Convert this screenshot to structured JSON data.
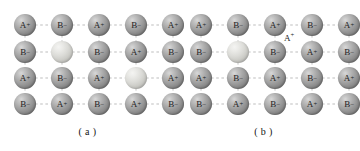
{
  "figure": {
    "kind": "crystal-lattice-defect-diagram",
    "background_color": "#ffffff",
    "bond_color": "#bdbdbd",
    "ion_color": "#909090",
    "vacancy_color": "#dcdcd8",
    "label_color": "#1d1d1d"
  },
  "layout": {
    "columns": 5,
    "rows": 4,
    "col_x": [
      25,
      62,
      99,
      136,
      173
    ],
    "row_y": [
      25,
      52,
      78,
      104
    ],
    "node_radius": 11
  },
  "panels": [
    {
      "id": "a",
      "caption": "( a )",
      "grid": [
        [
          {
            "label": "A",
            "sign": "+",
            "type": "ion"
          },
          {
            "label": "B",
            "sign": "–",
            "type": "ion"
          },
          {
            "label": "A",
            "sign": "+",
            "type": "ion"
          },
          {
            "label": "B",
            "sign": "–",
            "type": "ion"
          },
          {
            "label": "A",
            "sign": "+",
            "type": "ion"
          }
        ],
        [
          {
            "label": "B",
            "sign": "–",
            "type": "ion"
          },
          {
            "label": "",
            "sign": "",
            "type": "vacancy"
          },
          {
            "label": "B",
            "sign": "–",
            "type": "ion"
          },
          {
            "label": "A",
            "sign": "+",
            "type": "ion"
          },
          {
            "label": "B",
            "sign": "–",
            "type": "ion"
          }
        ],
        [
          {
            "label": "A",
            "sign": "+",
            "type": "ion"
          },
          {
            "label": "B",
            "sign": "–",
            "type": "ion"
          },
          {
            "label": "A",
            "sign": "+",
            "type": "ion"
          },
          {
            "label": "",
            "sign": "",
            "type": "vacancy"
          },
          {
            "label": "A",
            "sign": "+",
            "type": "ion"
          }
        ],
        [
          {
            "label": "B",
            "sign": "–",
            "type": "ion"
          },
          {
            "label": "A",
            "sign": "+",
            "type": "ion"
          },
          {
            "label": "B",
            "sign": "–",
            "type": "ion"
          },
          {
            "label": "A",
            "sign": "+",
            "type": "ion"
          },
          {
            "label": "B",
            "sign": "–",
            "type": "ion"
          }
        ]
      ],
      "interstitials": []
    },
    {
      "id": "b",
      "caption": "( b )",
      "grid": [
        [
          {
            "label": "A",
            "sign": "+",
            "type": "ion"
          },
          {
            "label": "B",
            "sign": "–",
            "type": "ion"
          },
          {
            "label": "A",
            "sign": "+",
            "type": "ion"
          },
          {
            "label": "B",
            "sign": "–",
            "type": "ion"
          },
          {
            "label": "A",
            "sign": "+",
            "type": "ion"
          }
        ],
        [
          {
            "label": "B",
            "sign": "–",
            "type": "ion"
          },
          {
            "label": "",
            "sign": "",
            "type": "vacancy"
          },
          {
            "label": "B",
            "sign": "–",
            "type": "ion"
          },
          {
            "label": "A",
            "sign": "+",
            "type": "ion"
          },
          {
            "label": "B",
            "sign": "–",
            "type": "ion"
          }
        ],
        [
          {
            "label": "A",
            "sign": "+",
            "type": "ion"
          },
          {
            "label": "B",
            "sign": "–",
            "type": "ion"
          },
          {
            "label": "A",
            "sign": "+",
            "type": "ion"
          },
          {
            "label": "B",
            "sign": "–",
            "type": "ion"
          },
          {
            "label": "A",
            "sign": "+",
            "type": "ion"
          }
        ],
        [
          {
            "label": "B",
            "sign": "–",
            "type": "ion"
          },
          {
            "label": "A",
            "sign": "+",
            "type": "ion"
          },
          {
            "label": "B",
            "sign": "–",
            "type": "ion"
          },
          {
            "label": "A",
            "sign": "+",
            "type": "ion"
          },
          {
            "label": "B",
            "sign": "–",
            "type": "ion"
          }
        ]
      ],
      "interstitials": [
        {
          "label": "A",
          "sign": "+",
          "x": 113,
          "y": 37
        }
      ]
    }
  ]
}
